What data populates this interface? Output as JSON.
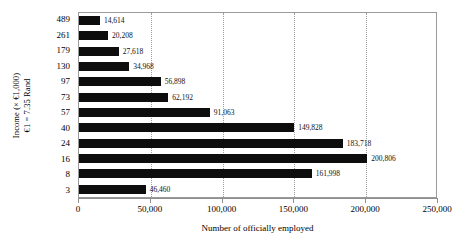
{
  "chart_data": {
    "type": "bar",
    "orientation": "horizontal",
    "title": "",
    "xlabel": "Number of officially employed",
    "ylabel_line1": "Income (× €1,000)",
    "ylabel_line2": "€1 = 7.35  Rand",
    "categories": [
      "489",
      "261",
      "179",
      "130",
      "97",
      "73",
      "57",
      "40",
      "24",
      "16",
      "8",
      "3"
    ],
    "values": [
      14614,
      20208,
      27618,
      34968,
      56898,
      62192,
      91063,
      149828,
      183718,
      200806,
      161998,
      46460
    ],
    "value_labels": [
      "14,614",
      "20,208",
      "27,618",
      "34,968",
      "56,898",
      "62,192",
      "91,063",
      "149,828",
      "183,718",
      "200,806",
      "161,998",
      "46,460"
    ],
    "xlim": [
      0,
      250000
    ],
    "xticks": [
      0,
      50000,
      100000,
      150000,
      200000,
      250000
    ],
    "xtick_labels": [
      "0",
      "50,000",
      "100,000",
      "150,000",
      "200,000",
      "250,000"
    ],
    "gridlines": [
      50000,
      100000,
      150000,
      200000
    ],
    "grid": true,
    "grid_style": "dotted",
    "legend": null,
    "bar_color": "#0d0d0d",
    "plot_border_color": "#9a9a9a",
    "background": "#ffffff"
  }
}
